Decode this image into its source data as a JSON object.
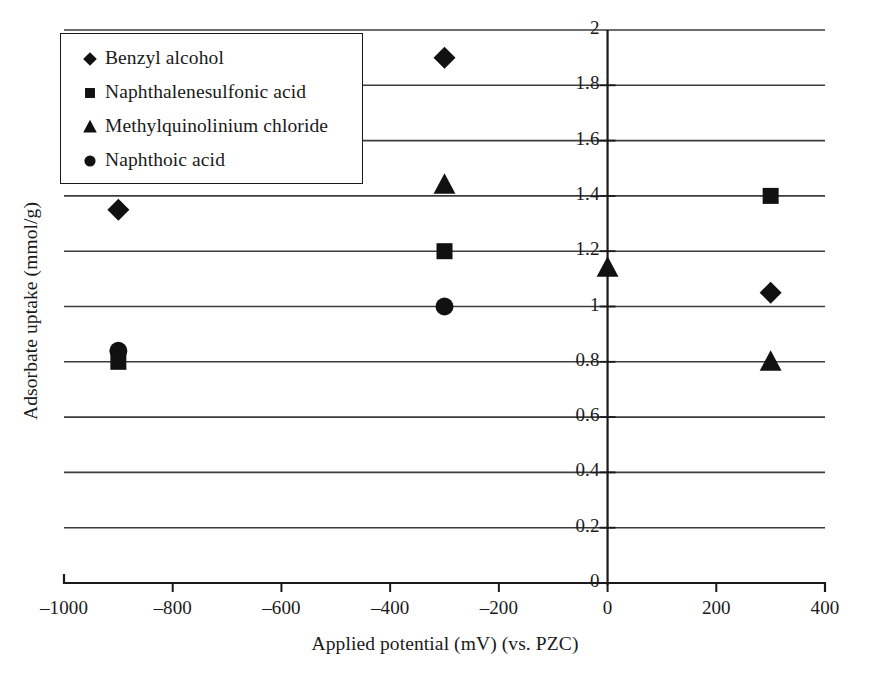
{
  "chart_data": {
    "type": "scatter",
    "title": "",
    "xlabel": "Applied potential (mV) (vs. PZC)",
    "ylabel": "Adsorbate uptake (mmol/g)",
    "xlim": [
      -1000,
      400
    ],
    "ylim": [
      0,
      2
    ],
    "xticks": [
      -1000,
      -800,
      -600,
      -400,
      -200,
      0,
      200,
      400
    ],
    "xtick_labels": [
      "–1000",
      "–800",
      "–600",
      "–400",
      "–200",
      "0",
      "200",
      "400"
    ],
    "yticks": [
      0,
      0.2,
      0.4,
      0.6,
      0.8,
      1,
      1.2,
      1.4,
      1.6,
      1.8,
      2
    ],
    "ytick_labels": [
      "0",
      "0.2",
      "0.4",
      "0.6",
      "0.8",
      "1",
      "1.2",
      "1.4",
      "1.6",
      "1.8",
      "2"
    ],
    "grid": "horizontal",
    "legend_position": "top-left",
    "series": [
      {
        "name": "Benzyl alcohol",
        "marker": "diamond",
        "color": "#111111",
        "points": [
          {
            "x": -900,
            "y": 1.35
          },
          {
            "x": -300,
            "y": 1.9
          },
          {
            "x": 300,
            "y": 1.05
          }
        ]
      },
      {
        "name": "Naphthalenesulfonic acid",
        "marker": "square",
        "color": "#111111",
        "points": [
          {
            "x": -900,
            "y": 0.8
          },
          {
            "x": -300,
            "y": 1.2
          },
          {
            "x": 300,
            "y": 1.4
          }
        ]
      },
      {
        "name": "Methylquinolinium chloride",
        "marker": "triangle",
        "color": "#111111",
        "points": [
          {
            "x": -300,
            "y": 1.44
          },
          {
            "x": 0,
            "y": 1.14
          },
          {
            "x": 300,
            "y": 0.8
          }
        ]
      },
      {
        "name": "Naphthoic acid",
        "marker": "circle",
        "color": "#111111",
        "points": [
          {
            "x": -900,
            "y": 0.84
          },
          {
            "x": -300,
            "y": 1.0
          }
        ]
      }
    ]
  },
  "legend": {
    "items": [
      {
        "label": "Benzyl alcohol",
        "marker": "diamond"
      },
      {
        "label": "Naphthalenesulfonic acid",
        "marker": "square"
      },
      {
        "label": "Methylquinolinium chloride",
        "marker": "triangle"
      },
      {
        "label": "Naphthoic acid",
        "marker": "circle"
      }
    ]
  },
  "axes": {
    "x_title": "Applied potential (mV) (vs. PZC)",
    "y_title": "Adsorbate uptake (mmol/g)"
  },
  "style": {
    "axis_color": "#1a1a1a",
    "grid_color": "#3c3c3c",
    "marker_color": "#111111",
    "background": "#ffffff"
  }
}
